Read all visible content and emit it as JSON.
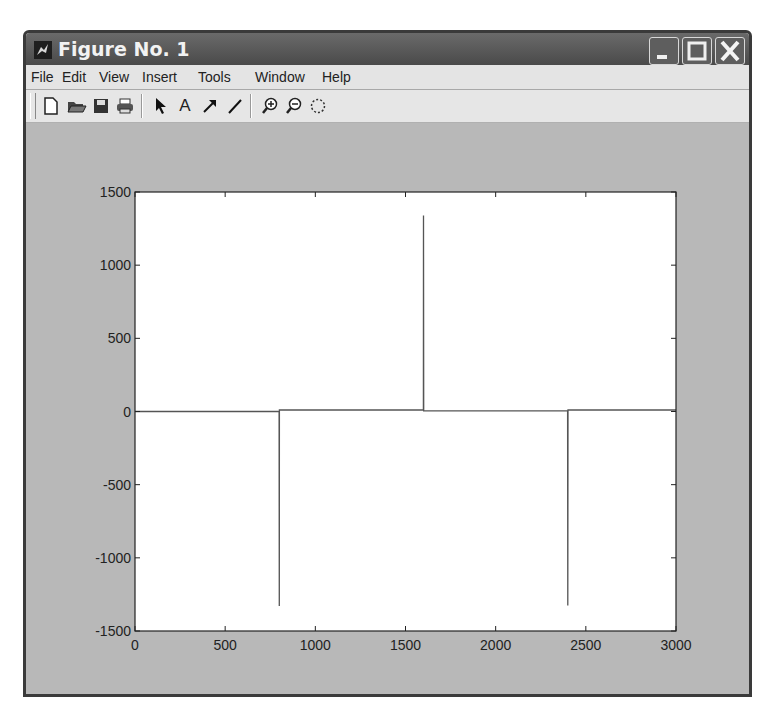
{
  "window": {
    "title": "Figure No. 1",
    "controls": {
      "minimize": "minimize",
      "maximize": "maximize",
      "close": "close"
    }
  },
  "menubar": {
    "items": [
      {
        "label": "File",
        "mnemonic": "F"
      },
      {
        "label": "Edit",
        "mnemonic": "E"
      },
      {
        "label": "View",
        "mnemonic": "V"
      },
      {
        "label": "Insert",
        "mnemonic": "I"
      },
      {
        "label": "Tools",
        "mnemonic": "T"
      },
      {
        "label": "Window",
        "mnemonic": "W"
      },
      {
        "label": "Help",
        "mnemonic": "H"
      }
    ]
  },
  "toolbar": {
    "buttons": [
      {
        "name": "new-figure",
        "icon": "new-file-icon"
      },
      {
        "name": "open-file",
        "icon": "open-folder-icon"
      },
      {
        "name": "save-figure",
        "icon": "save-icon"
      },
      {
        "name": "print-figure",
        "icon": "print-icon"
      },
      {
        "name": "edit-plot",
        "icon": "pointer-arrow-icon"
      },
      {
        "name": "insert-text",
        "icon": "text-a-icon",
        "glyph": "A"
      },
      {
        "name": "insert-arrow",
        "icon": "arrow-icon"
      },
      {
        "name": "insert-line",
        "icon": "line-icon"
      },
      {
        "name": "zoom-in",
        "icon": "zoom-in-icon"
      },
      {
        "name": "zoom-out",
        "icon": "zoom-out-icon"
      },
      {
        "name": "rotate-3d",
        "icon": "rotate-icon"
      }
    ]
  },
  "colors": {
    "figure_bg": "#b8b8b8",
    "axes_bg": "#ffffff",
    "line": "#555555",
    "titlebar": "#555555"
  },
  "chart_data": {
    "type": "line",
    "title": "",
    "xlabel": "",
    "ylabel": "",
    "xlim": [
      0,
      3000
    ],
    "ylim": [
      -1500,
      1500
    ],
    "xticks": [
      0,
      500,
      1000,
      1500,
      2000,
      2500,
      3000
    ],
    "yticks": [
      1500,
      1000,
      500,
      0,
      -500,
      -1000,
      -1500
    ],
    "xtick_labels": [
      "0",
      "500",
      "1000",
      "1500",
      "2000",
      "2500",
      "3000"
    ],
    "ytick_labels": [
      "1500",
      "1000",
      "500",
      "0",
      "-500",
      "-1000",
      "-1500"
    ],
    "grid": false,
    "legend": null,
    "series": [
      {
        "name": "signal",
        "description": "near-zero baseline with three impulse spikes",
        "x": [
          0,
          799,
          800,
          801,
          1599,
          1600,
          1601,
          2399,
          2400,
          2401,
          3000
        ],
        "y": [
          0,
          0,
          -1330,
          10,
          10,
          1340,
          5,
          5,
          -1325,
          10,
          10
        ]
      }
    ]
  }
}
